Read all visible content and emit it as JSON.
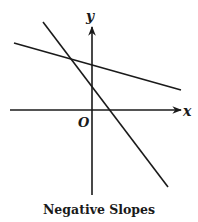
{
  "diagram": {
    "caption": "Negative Slopes",
    "axes": {
      "x_label": "x",
      "y_label": "y",
      "origin_label": "O"
    },
    "lines": [
      {
        "name": "shallow-negative-slope-line",
        "from": [
          14,
          43
        ],
        "to": [
          181,
          90
        ]
      },
      {
        "name": "steep-negative-slope-line",
        "from": [
          43,
          22
        ],
        "to": [
          168,
          187
        ]
      }
    ],
    "colors": {
      "stroke": "#1a1a1a",
      "background": "#ffffff"
    }
  }
}
